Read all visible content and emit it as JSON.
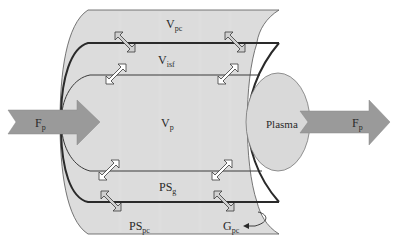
{
  "diagram": {
    "type": "compartment-model",
    "colors": {
      "tissue_fill": "#dcdcdc",
      "plasma_fill": "#d9d9d9",
      "flow_arrow_fill": "#9a9a9a",
      "line": "#3a3a3a",
      "exchange_arrow_fill": "#ffffff"
    },
    "labels": {
      "v_pc": {
        "main": "V",
        "sub": "pc"
      },
      "v_isf": {
        "main": "V",
        "sub": "isf"
      },
      "v_p": {
        "main": "V",
        "sub": "p"
      },
      "ps_g": {
        "main": "PS",
        "sub": "g"
      },
      "ps_pc": {
        "main": "PS",
        "sub": "pc"
      },
      "g_pc": {
        "main": "G",
        "sub": "pc"
      },
      "plasma": "Plasma",
      "flow_in": {
        "main": "F",
        "sub": "p"
      },
      "flow_out": {
        "main": "F",
        "sub": "p"
      }
    },
    "exchange_arrows": [
      {
        "id": "top-left-pc-isf",
        "style": "outlined-gray"
      },
      {
        "id": "top-left-isf-p",
        "style": "white"
      },
      {
        "id": "top-right-pc-isf",
        "style": "outlined-gray"
      },
      {
        "id": "top-right-isf-p",
        "style": "white"
      },
      {
        "id": "bottom-left-p-g",
        "style": "white"
      },
      {
        "id": "bottom-left-g-pc",
        "style": "outlined-gray"
      },
      {
        "id": "bottom-right-p-g",
        "style": "white"
      },
      {
        "id": "bottom-right-g-pc",
        "style": "outlined-gray"
      }
    ]
  }
}
